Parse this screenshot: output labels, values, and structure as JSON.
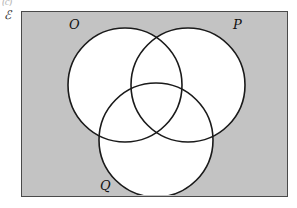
{
  "figure": {
    "type": "venn-diagram",
    "set_count": 3,
    "top_artifact": "(c)",
    "universal_set_label": "ℰ",
    "background_color": "#ffffff",
    "region_fill_color": "#c3c3c3",
    "circle_fill_color": "#ffffff",
    "stroke_color": "#1a1a1a",
    "border_color": "#4a4a4a",
    "rectangle": {
      "x": 21,
      "y": 11,
      "width": 267,
      "height": 186
    },
    "circles": [
      {
        "label": "O",
        "cx": 125,
        "cy": 85,
        "r": 57,
        "label_x": 69,
        "label_y": 17
      },
      {
        "label": "P",
        "cx": 188,
        "cy": 85,
        "r": 57,
        "label_x": 233,
        "label_y": 17
      },
      {
        "label": "Q",
        "cx": 156,
        "cy": 140,
        "r": 57,
        "label_x": 100,
        "label_y": 178
      }
    ]
  }
}
